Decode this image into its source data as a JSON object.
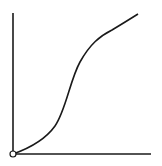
{
  "diagram": {
    "type": "sigmoid-curve-axes",
    "colors": {
      "background": "#ffffff",
      "stroke": "#1a1a1a",
      "origin_fill": "#ffffff"
    },
    "axes": {
      "origin": [
        13,
        154
      ],
      "y_axis_top": [
        13,
        13
      ],
      "x_axis_end": [
        151,
        154
      ]
    },
    "curve": {
      "shape": "S-curve",
      "path": "M13,154 C30,148 45,140 55,126 C66,110 70,80 80,62 C90,44 100,36 112,30 C122,24 130,19 138,14"
    },
    "origin_marker": {
      "shape": "open-circle",
      "radius": 3
    }
  }
}
